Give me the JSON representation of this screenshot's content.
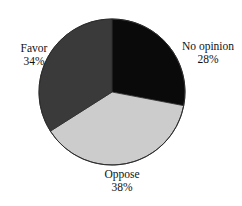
{
  "background_color": "#ffffff",
  "chart_data": {
    "type": "pie",
    "title": "",
    "subtitle": "",
    "xlabel": "",
    "ylabel": "",
    "legend_position": "none",
    "grid": false,
    "labels_placement": "outside-adjacent",
    "start_angle_deg": 0,
    "direction": "clockwise",
    "center_px": [
      112,
      92
    ],
    "radius_px": 73,
    "outline_color": "#2b2b2b",
    "categories": [
      "No opinion",
      "Oppose",
      "Favor"
    ],
    "values": [
      28,
      38,
      34
    ],
    "value_unit": "%",
    "slices": [
      {
        "label": "No opinion",
        "value": 28,
        "value_text": "28%",
        "color": "#0a0a0a",
        "start_angle_deg": 0,
        "end_angle_deg": 100.8,
        "text_color": "#111111"
      },
      {
        "label": "Oppose",
        "value": 38,
        "value_text": "38%",
        "color": "#cccccc",
        "start_angle_deg": 100.8,
        "end_angle_deg": 237.6,
        "text_color": "#111111"
      },
      {
        "label": "Favor",
        "value": 34,
        "value_text": "34%",
        "color": "#3a3a3a",
        "start_angle_deg": 237.6,
        "end_angle_deg": 360,
        "text_color": "#111111"
      }
    ]
  },
  "labels": {
    "no_opinion": {
      "name": "No opinion",
      "value": "28%"
    },
    "oppose": {
      "name": "Oppose",
      "value": "38%"
    },
    "favor": {
      "name": "Favor",
      "value": "34%"
    }
  }
}
